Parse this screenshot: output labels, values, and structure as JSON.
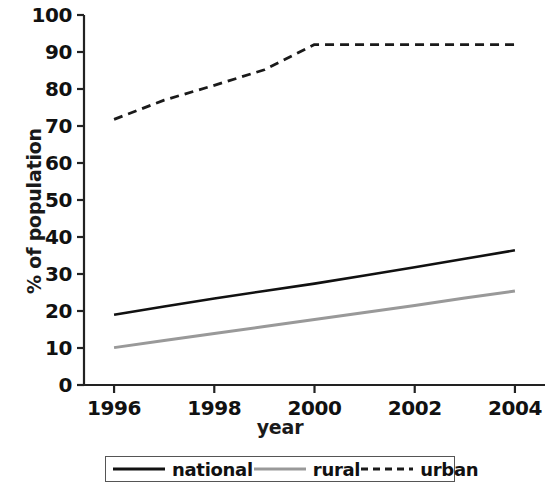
{
  "chart_data": {
    "type": "line",
    "title": "",
    "xlabel": "year",
    "ylabel": "% of population",
    "xlim": [
      1995.4,
      2004.6
    ],
    "ylim": [
      0,
      100
    ],
    "grid": false,
    "legend_position": "bottom",
    "x": [
      1996,
      1997,
      1998,
      1999,
      2000,
      2001,
      2002,
      2003,
      2004
    ],
    "xticks": [
      "1996",
      "1998",
      "2000",
      "2002",
      "2004"
    ],
    "xtick_values": [
      1996,
      1998,
      2000,
      2002,
      2004
    ],
    "yticks": [
      "0",
      "10",
      "20",
      "30",
      "40",
      "50",
      "60",
      "70",
      "80",
      "90",
      "100"
    ],
    "ytick_values": [
      0,
      10,
      20,
      30,
      40,
      50,
      60,
      70,
      80,
      90,
      100
    ],
    "series": [
      {
        "name": "national",
        "color": "#111111",
        "style": "solid",
        "width": 2.6,
        "values": [
          19.0,
          21.2,
          23.4,
          25.4,
          27.4,
          29.6,
          31.8,
          34.1,
          36.4
        ]
      },
      {
        "name": "rural",
        "color": "#999999",
        "style": "solid",
        "width": 3.0,
        "values": [
          10.1,
          12.0,
          13.9,
          15.8,
          17.7,
          19.6,
          21.5,
          23.5,
          25.4
        ]
      },
      {
        "name": "urban",
        "color": "#1a1a1a",
        "style": "dashed",
        "width": 2.8,
        "values": [
          71.8,
          77.0,
          81.0,
          85.2,
          92.0,
          92.0,
          92.0,
          92.0,
          92.0
        ]
      }
    ]
  },
  "legend": {
    "entries": [
      {
        "label": "national",
        "swatch": "solid-black-line-swatch"
      },
      {
        "label": "rural",
        "swatch": "solid-gray-line-swatch"
      },
      {
        "label": "urban",
        "swatch": "dashed-black-line-swatch"
      }
    ]
  },
  "axes": {
    "x_title": "year",
    "y_title": "% of population"
  }
}
